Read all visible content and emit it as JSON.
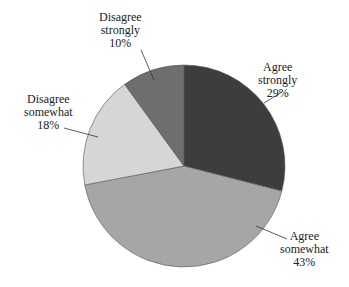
{
  "chart_data": {
    "type": "pie",
    "title": "",
    "categories": [
      "Agree strongly",
      "Agree somewhat",
      "Disagree somewhat",
      "Disagree strongly"
    ],
    "values": [
      29,
      43,
      18,
      10
    ],
    "unit": "%",
    "colors": [
      "#3d3d3d",
      "#a6a6a6",
      "#d6d6d6",
      "#6e6e6e"
    ],
    "start_angle_deg": 0,
    "direction": "clockwise",
    "labels": [
      {
        "line1": "Agree",
        "line2": "strongly",
        "pct": "29%"
      },
      {
        "line1": "Agree",
        "line2": "somewhat",
        "pct": "43%"
      },
      {
        "line1": "Disagree",
        "line2": "somewhat",
        "pct": "18%"
      },
      {
        "line1": "Disagree",
        "line2": "strongly",
        "pct": "10%"
      }
    ]
  }
}
